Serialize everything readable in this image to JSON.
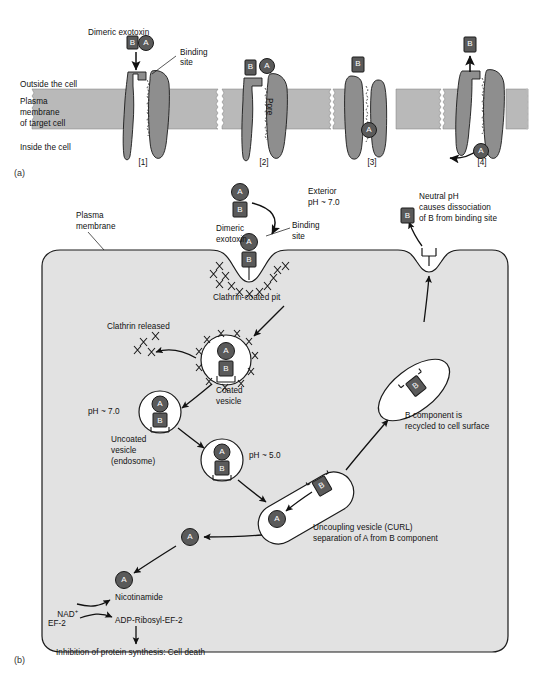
{
  "figure": {
    "panel_a_tag": "(a)",
    "panel_b_tag": "(b)"
  },
  "panel_a": {
    "membrane_labels": {
      "outside": "Outside the cell",
      "membrane_line1": "Plasma",
      "membrane_line2": "membrane",
      "membrane_line3": "of target cell",
      "inside": "Inside the cell"
    },
    "callouts": {
      "dimeric_exotoxin": "Dimeric exotoxin",
      "binding_site_line1": "Binding",
      "binding_site_line2": "site",
      "pore": "Pore"
    },
    "steps": [
      {
        "tag": "[1]",
        "toxin_b": "B",
        "toxin_a": "A"
      },
      {
        "tag": "[2]",
        "toxin_b": "B",
        "toxin_a": "A"
      },
      {
        "tag": "[3]",
        "toxin_b": "B",
        "toxin_a": "A"
      },
      {
        "tag": "[4]",
        "toxin_b": "B",
        "toxin_a": "A"
      }
    ]
  },
  "panel_b": {
    "labels": {
      "plasma_membrane_l1": "Plasma",
      "plasma_membrane_l2": "membrane",
      "exterior_l1": "Exterior",
      "exterior_l2": "pH ~ 7.0",
      "dimeric_exotoxin_l1": "Dimeric",
      "dimeric_exotoxin_l2": "exotoxin",
      "binding_site_l1": "Binding",
      "binding_site_l2": "site",
      "neutral_ph_l1": "Neutral pH",
      "neutral_ph_l2": "causes dissociation",
      "neutral_ph_l3": "of B from binding site",
      "clathrin_coated_pit": "Clathrin-coated pit",
      "clathrin_released": "Clathrin released",
      "coated_vesicle_l1": "Coated",
      "coated_vesicle_l2": "vesicle",
      "ph_70": "pH ~ 7.0",
      "uncoated_vesicle_l1": "Uncoated",
      "uncoated_vesicle_l2": "vesicle",
      "uncoated_vesicle_l3": "(endosome)",
      "ph_50": "pH ~ 5.0",
      "curl_l1": "Uncoupling vesicle (CURL)",
      "curl_l2": "separation of A from B component",
      "recycled_l1": "B component is",
      "recycled_l2": "recycled to cell surface"
    },
    "components": {
      "a": "A",
      "b": "B"
    },
    "reaction": {
      "nad": "NAD",
      "nad_sup": "+",
      "ef2": "EF-2",
      "nicotinamide": "Nicotinamide",
      "adp_ribosyl": "ADP-Ribosyl-EF-2",
      "outcome": "Inhibition of protein synthesis: Cell death"
    }
  },
  "colors": {
    "membrane_fill": "#b9b9b9",
    "protein_fill": "#8e8e8e",
    "cytoplasm_fill": "#e2e2e2",
    "toxin_dark": "#5a5a5a",
    "vesicle_fill": "#ffffff",
    "stroke": "#1a1a1a",
    "background": "#ffffff"
  }
}
